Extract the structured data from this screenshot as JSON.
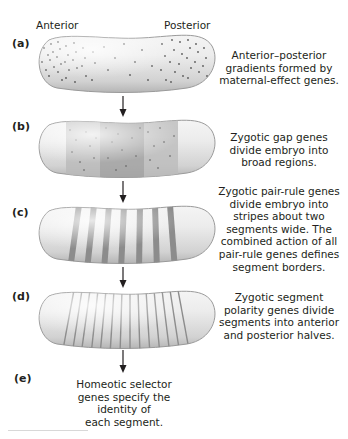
{
  "header": {
    "anterior_label": "Anterior",
    "posterior_label": "Posterior"
  },
  "stages": [
    {
      "id": "a",
      "label": "(a)",
      "caption_lines": [
        "Anterior–posterior",
        "gradients formed by",
        "maternal-effect genes."
      ],
      "pattern": "gradient-dots"
    },
    {
      "id": "b",
      "label": "(b)",
      "caption_lines": [
        "Zygotic gap genes",
        "divide embryo into",
        "broad regions."
      ],
      "pattern": "broad-regions"
    },
    {
      "id": "c",
      "label": "(c)",
      "caption_lines": [
        "Zygotic pair-rule genes",
        "divide embryo into",
        "stripes about two",
        "segments wide. The",
        "combined action of all",
        "pair-rule genes defines",
        "segment borders."
      ],
      "pattern": "seven-stripes"
    },
    {
      "id": "d",
      "label": "(d)",
      "caption_lines": [
        "Zygotic segment",
        "polarity genes divide",
        "segments into anterior",
        "and posterior halves."
      ],
      "pattern": "fourteen-stripes"
    },
    {
      "id": "e",
      "label": "(e)",
      "caption_lines": [
        "Homeotic selector",
        "genes specify the",
        "identity of",
        "each segment."
      ],
      "pattern": "none"
    }
  ],
  "colors": {
    "embryo_fill": "#e6e6e6",
    "embryo_edge": "#9a9a9a",
    "stripe": "#8c8c8c",
    "region_dark": "#a9a9a9",
    "region_mid": "#c4c4c4",
    "dot": "#5a5a5a",
    "arrow": "#231f20"
  }
}
